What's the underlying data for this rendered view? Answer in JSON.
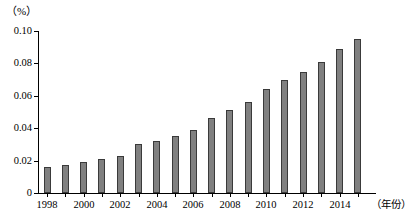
{
  "chart_data": {
    "type": "bar",
    "title": "",
    "subtitle": "",
    "xlabel": "（年份）",
    "ylabel": "（%）",
    "categories": [
      "1998",
      "1999",
      "2000",
      "2001",
      "2002",
      "2003",
      "2004",
      "2005",
      "2006",
      "2007",
      "2008",
      "2009",
      "2010",
      "2011",
      "2012",
      "2013",
      "2014",
      "2015"
    ],
    "values": [
      0.016,
      0.017,
      0.019,
      0.021,
      0.023,
      0.03,
      0.032,
      0.035,
      0.039,
      0.046,
      0.051,
      0.056,
      0.064,
      0.07,
      0.075,
      0.081,
      0.089,
      0.095
    ],
    "ylim": [
      0,
      0.1
    ],
    "yticks": [
      0,
      0.02,
      0.04,
      0.06,
      0.08,
      0.1
    ],
    "ytick_labels": [
      "0",
      "0.02",
      "0.04",
      "0.06",
      "0.08",
      "0.10"
    ],
    "xtick_labels": [
      "1998",
      "2000",
      "2002",
      "2004",
      "2006",
      "2008",
      "2010",
      "2012",
      "2014"
    ],
    "xtick_categories": [
      "1998",
      "2000",
      "2002",
      "2004",
      "2006",
      "2008",
      "2010",
      "2012",
      "2014"
    ],
    "grid": false,
    "legend": null,
    "legend_position": "none",
    "series": [
      {
        "name": "",
        "values": [
          0.016,
          0.017,
          0.019,
          0.021,
          0.023,
          0.03,
          0.032,
          0.035,
          0.039,
          0.046,
          0.051,
          0.056,
          0.064,
          0.07,
          0.075,
          0.081,
          0.089,
          0.095
        ]
      }
    ],
    "bar_color": "#808080",
    "bar_edge_color": "#3a3a3a",
    "axis_color": "#000000",
    "background_color": "#ffffff"
  },
  "axes": {
    "unit_label": "（%）",
    "x_axis_title": "（年份）"
  }
}
